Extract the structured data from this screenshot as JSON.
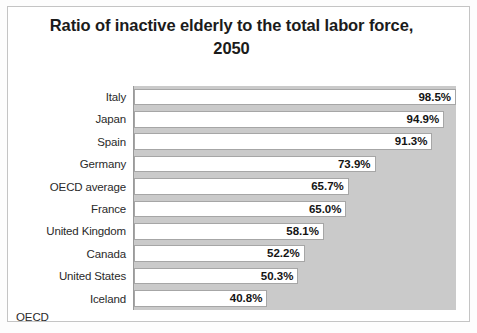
{
  "chart_data": {
    "type": "bar",
    "orientation": "horizontal",
    "title": "Ratio of inactive elderly to the total labor force, 2050",
    "title_lines": [
      "Ratio of inactive elderly to the total labor force,",
      "2050"
    ],
    "xlabel": "",
    "ylabel": "",
    "categories": [
      "Italy",
      "Japan",
      "Spain",
      "Germany",
      "OECD average",
      "France",
      "United Kingdom",
      "Canada",
      "United States",
      "Iceland"
    ],
    "values": [
      98.5,
      94.9,
      91.3,
      73.9,
      65.7,
      65.0,
      58.1,
      52.2,
      50.3,
      40.8
    ],
    "value_labels": [
      "98.5%",
      "94.9%",
      "91.3%",
      "73.9%",
      "65.7%",
      "65.0%",
      "58.1%",
      "52.2%",
      "50.3%",
      "40.8%"
    ],
    "unit": "%",
    "xlim": [
      0,
      98.5
    ],
    "grid": false,
    "legend": false,
    "plot_background_color": "#cacaca",
    "bar_fill_color": "#ffffff",
    "bar_border_color": "#a6a6a6",
    "text_color": "#141414"
  },
  "source": {
    "label": "OECD"
  }
}
